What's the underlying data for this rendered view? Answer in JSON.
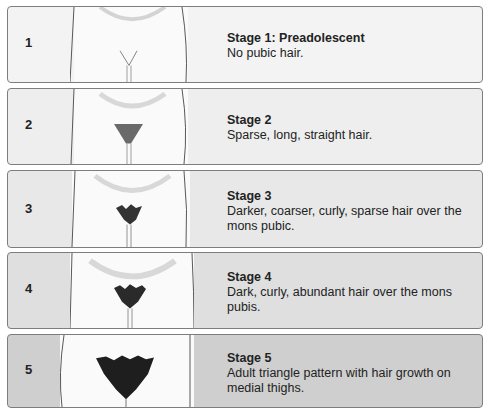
{
  "stages": [
    {
      "number": "1",
      "title": "Stage 1: Preadolescent",
      "description": "No pubic hair.",
      "bg": "#f3f3f3"
    },
    {
      "number": "2",
      "title": "Stage 2",
      "description": "Sparse, long, straight hair.",
      "bg": "#eeeeee"
    },
    {
      "number": "3",
      "title": "Stage 3",
      "description": "Darker, coarser, curly, sparse hair over the mons pubic.",
      "bg": "#e8e8e8"
    },
    {
      "number": "4",
      "title": "Stage 4",
      "description": "Dark, curly, abundant hair over the mons pubis.",
      "bg": "#dfdfdf"
    },
    {
      "number": "5",
      "title": "Stage 5",
      "description": "Adult triangle pattern with hair growth on medial thighs.",
      "bg": "#cfcfcf"
    }
  ]
}
